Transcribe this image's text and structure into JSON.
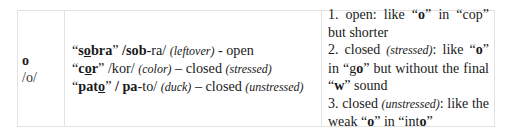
{
  "row": {
    "vowel": "o",
    "ipa": "/o/",
    "examples": [
      {
        "q_open": "“",
        "word_pre": "s",
        "word_under": "o",
        "word_post": "bra",
        "q_close": "”",
        "pron_bold": " /sob",
        "pron_rest": "-ra/ ",
        "gloss": "(leftover)",
        "desc": " - open",
        "note": ""
      },
      {
        "q_open": "“",
        "word_pre": "c",
        "word_under": "o",
        "word_post": "r",
        "q_close": "”",
        "pron_bold": "",
        "pron_rest": " /kor/ ",
        "gloss": "(color)",
        "desc": " – closed ",
        "note": "(stressed)"
      },
      {
        "q_open": "“",
        "word_pre": "pat",
        "word_under": "o",
        "word_post": "",
        "q_close": "”",
        "pron_bold": " / pa",
        "pron_rest": "-to/ ",
        "gloss": "(duck)",
        "desc": " – closed ",
        "note": "(unstressed)"
      }
    ],
    "explanations": {
      "e1_a": "1. open: like “",
      "e1_b": "o",
      "e1_c": "” in “cop” but shorter",
      "e2_a": "2. closed ",
      "e2_note": "(stressed)",
      "e2_b": ": like “",
      "e2_c": "o",
      "e2_d": "” in “g",
      "e2_e": "o",
      "e2_f": "” but without the final “",
      "e2_g": "w",
      "e2_h": "” sound",
      "e3_a": "3. closed ",
      "e3_note": "(unstressed)",
      "e3_b": ": like the weak “",
      "e3_c": "o",
      "e3_d": "” in “int",
      "e3_e": "o",
      "e3_f": "”"
    }
  }
}
